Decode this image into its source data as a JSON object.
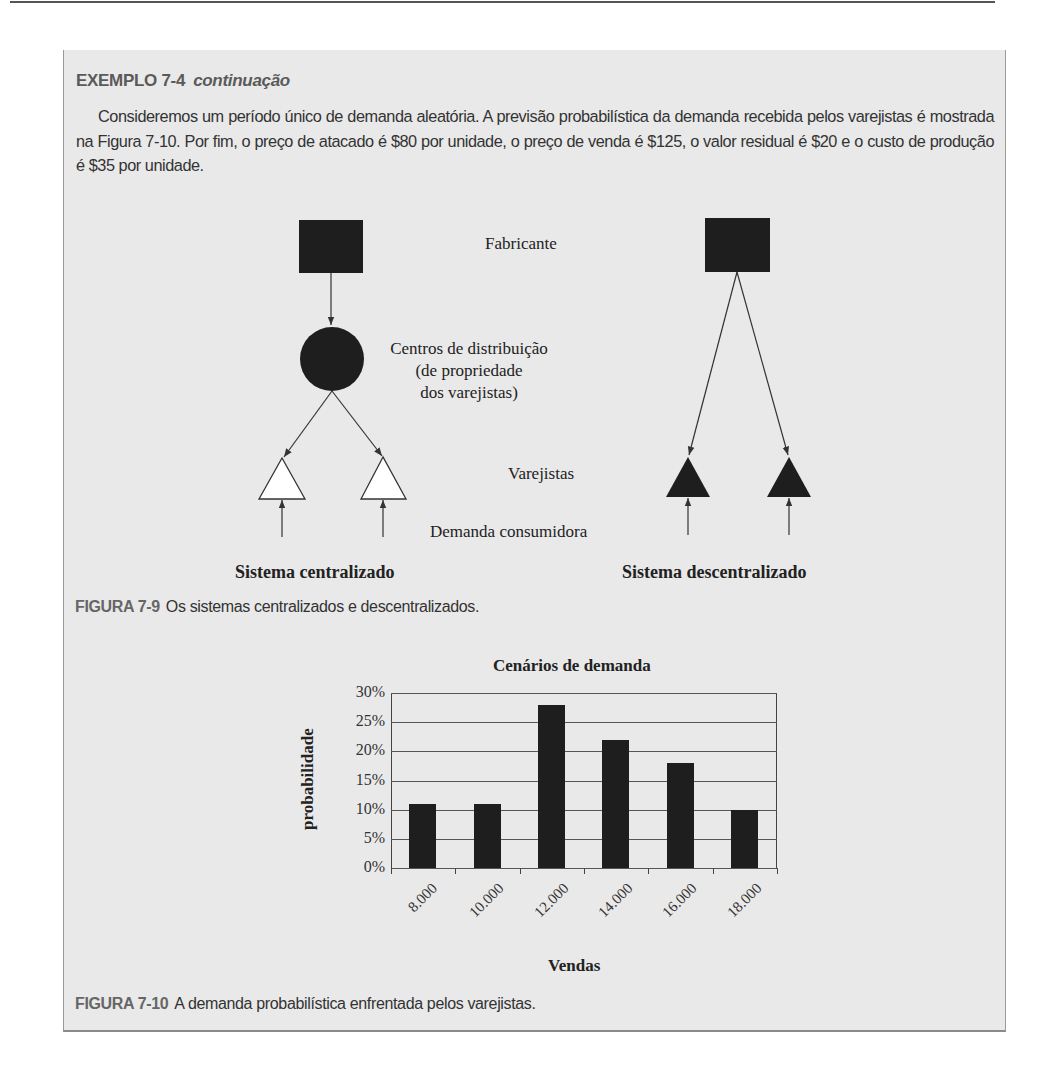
{
  "example": {
    "heading_number": "EXEMPLO 7-4",
    "heading_suffix": "continuação",
    "paragraph": "Consideremos um período único de demanda aleatória. A previsão probabilística da demanda recebida pelos varejistas é mostrada na Figura 7-10. Por fim, o preço de atacado é $80 por unidade, o preço de venda é $125, o valor residual é $20 e o custo de produção é $35 por unidade."
  },
  "figure_7_9": {
    "labels": {
      "manufacturer": "Fabricante",
      "dc_line1": "Centros de distribuição",
      "dc_line2": "(de propriedade",
      "dc_line3": "dos varejistas)",
      "retailers": "Varejistas",
      "consumer_demand": "Demanda consumidora"
    },
    "centralized_title": "Sistema centralizado",
    "decentralized_title": "Sistema descentralizado",
    "caption_number": "FIGURA 7-9",
    "caption_text": "Os sistemas centralizados e descentralizados."
  },
  "figure_7_10": {
    "caption_number": "FIGURA 7-10",
    "caption_text": "A demanda probabilística enfrentada pelos varejistas."
  },
  "chart_data": {
    "type": "bar",
    "title": "Cenários de demanda",
    "xlabel": "Vendas",
    "ylabel": "probabilidade",
    "categories": [
      "8.000",
      "10.000",
      "12.000",
      "14.000",
      "16.000",
      "18.000"
    ],
    "values": [
      0.11,
      0.11,
      0.28,
      0.22,
      0.18,
      0.1
    ],
    "value_format": "percent",
    "ylim": [
      0,
      0.3
    ],
    "yticks": [
      "0%",
      "5%",
      "10%",
      "15%",
      "20%",
      "25%",
      "30%"
    ],
    "grid": true,
    "legend": "none",
    "bar_color": "#1e1e1e"
  }
}
